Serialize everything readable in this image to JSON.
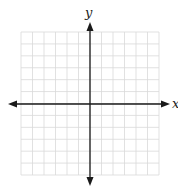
{
  "diagram": {
    "type": "coordinate-plane",
    "x_axis_label": "x",
    "y_axis_label": "y",
    "grid": {
      "columns": 12,
      "rows": 12,
      "columns_left_of_y_axis": 6,
      "columns_right_of_y_axis": 6,
      "rows_above_x_axis": 6,
      "rows_below_x_axis": 6,
      "tick_labels": "none"
    },
    "arrows": [
      "left",
      "right",
      "up",
      "down"
    ],
    "colors": {
      "grid_line": "#d9d9d9",
      "axis": "#1a1a1a",
      "background": "#ffffff"
    }
  }
}
